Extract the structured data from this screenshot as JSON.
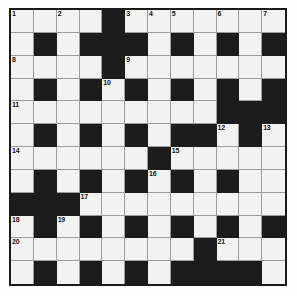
{
  "puzzle": {
    "title": "Crossword Grid",
    "columns": 12,
    "rows": 12,
    "colors": {
      "white_cell": "#f2f2f0",
      "black_cell": "#1c1c1c",
      "border": "#1a1a1a",
      "gridline": "#9d9d9d",
      "page_background": "#fdfdfd",
      "number_text": "#171717"
    },
    "legend": {
      "white_label": "open letter square",
      "black_label": "blocked square"
    },
    "grid": [
      [
        "w",
        "w",
        "w",
        "w",
        "b",
        "w",
        "w",
        "w",
        "w",
        "w",
        "w",
        "w"
      ],
      [
        "w",
        "b",
        "w",
        "b",
        "b",
        "b",
        "w",
        "b",
        "w",
        "b",
        "w",
        "b"
      ],
      [
        "w",
        "w",
        "w",
        "w",
        "b",
        "w",
        "w",
        "w",
        "w",
        "w",
        "w",
        "w"
      ],
      [
        "w",
        "b",
        "w",
        "b",
        "w",
        "b",
        "w",
        "b",
        "w",
        "b",
        "w",
        "b"
      ],
      [
        "w",
        "w",
        "w",
        "w",
        "w",
        "w",
        "w",
        "w",
        "w",
        "b",
        "b",
        "b"
      ],
      [
        "w",
        "b",
        "w",
        "b",
        "w",
        "b",
        "w",
        "b",
        "b",
        "w",
        "b",
        "w"
      ],
      [
        "w",
        "w",
        "w",
        "w",
        "w",
        "w",
        "b",
        "w",
        "w",
        "w",
        "w",
        "w"
      ],
      [
        "w",
        "b",
        "w",
        "b",
        "w",
        "b",
        "w",
        "b",
        "w",
        "b",
        "w",
        "w"
      ],
      [
        "b",
        "b",
        "b",
        "w",
        "w",
        "w",
        "w",
        "w",
        "w",
        "w",
        "w",
        "w"
      ],
      [
        "w",
        "b",
        "w",
        "b",
        "w",
        "b",
        "w",
        "b",
        "w",
        "b",
        "w",
        "b"
      ],
      [
        "w",
        "w",
        "w",
        "w",
        "w",
        "w",
        "w",
        "w",
        "b",
        "w",
        "w",
        "w"
      ],
      [
        "w",
        "b",
        "w",
        "b",
        "w",
        "b",
        "w",
        "b",
        "b",
        "b",
        "b",
        "w"
      ],
      [
        "w",
        "w",
        "w",
        "w",
        "w",
        "w",
        "w",
        "w",
        "b",
        "w",
        "w",
        "w"
      ]
    ],
    "numbers": [
      {
        "number": "1",
        "row": 0,
        "col": 0
      },
      {
        "number": "2",
        "row": 0,
        "col": 2
      },
      {
        "number": "3",
        "row": 0,
        "col": 5
      },
      {
        "number": "4",
        "row": 0,
        "col": 6
      },
      {
        "number": "5",
        "row": 0,
        "col": 7
      },
      {
        "number": "6",
        "row": 0,
        "col": 9
      },
      {
        "number": "7",
        "row": 0,
        "col": 11
      },
      {
        "number": "8",
        "row": 2,
        "col": 0
      },
      {
        "number": "9",
        "row": 2,
        "col": 5
      },
      {
        "number": "10",
        "row": 3,
        "col": 4
      },
      {
        "number": "11",
        "row": 4,
        "col": 0
      },
      {
        "number": "12",
        "row": 5,
        "col": 9
      },
      {
        "number": "13",
        "row": 5,
        "col": 11
      },
      {
        "number": "14",
        "row": 6,
        "col": 0
      },
      {
        "number": "15",
        "row": 6,
        "col": 7
      },
      {
        "number": "16",
        "row": 7,
        "col": 6
      },
      {
        "number": "17",
        "row": 8,
        "col": 3
      },
      {
        "number": "18",
        "row": 9,
        "col": 0
      },
      {
        "number": "19",
        "row": 9,
        "col": 2
      },
      {
        "number": "20",
        "row": 10,
        "col": 0
      },
      {
        "number": "21",
        "row": 10,
        "col": 9
      },
      {
        "number": "22",
        "row": 12,
        "col": 0
      },
      {
        "number": "23",
        "row": 12,
        "col": 9
      }
    ]
  }
}
